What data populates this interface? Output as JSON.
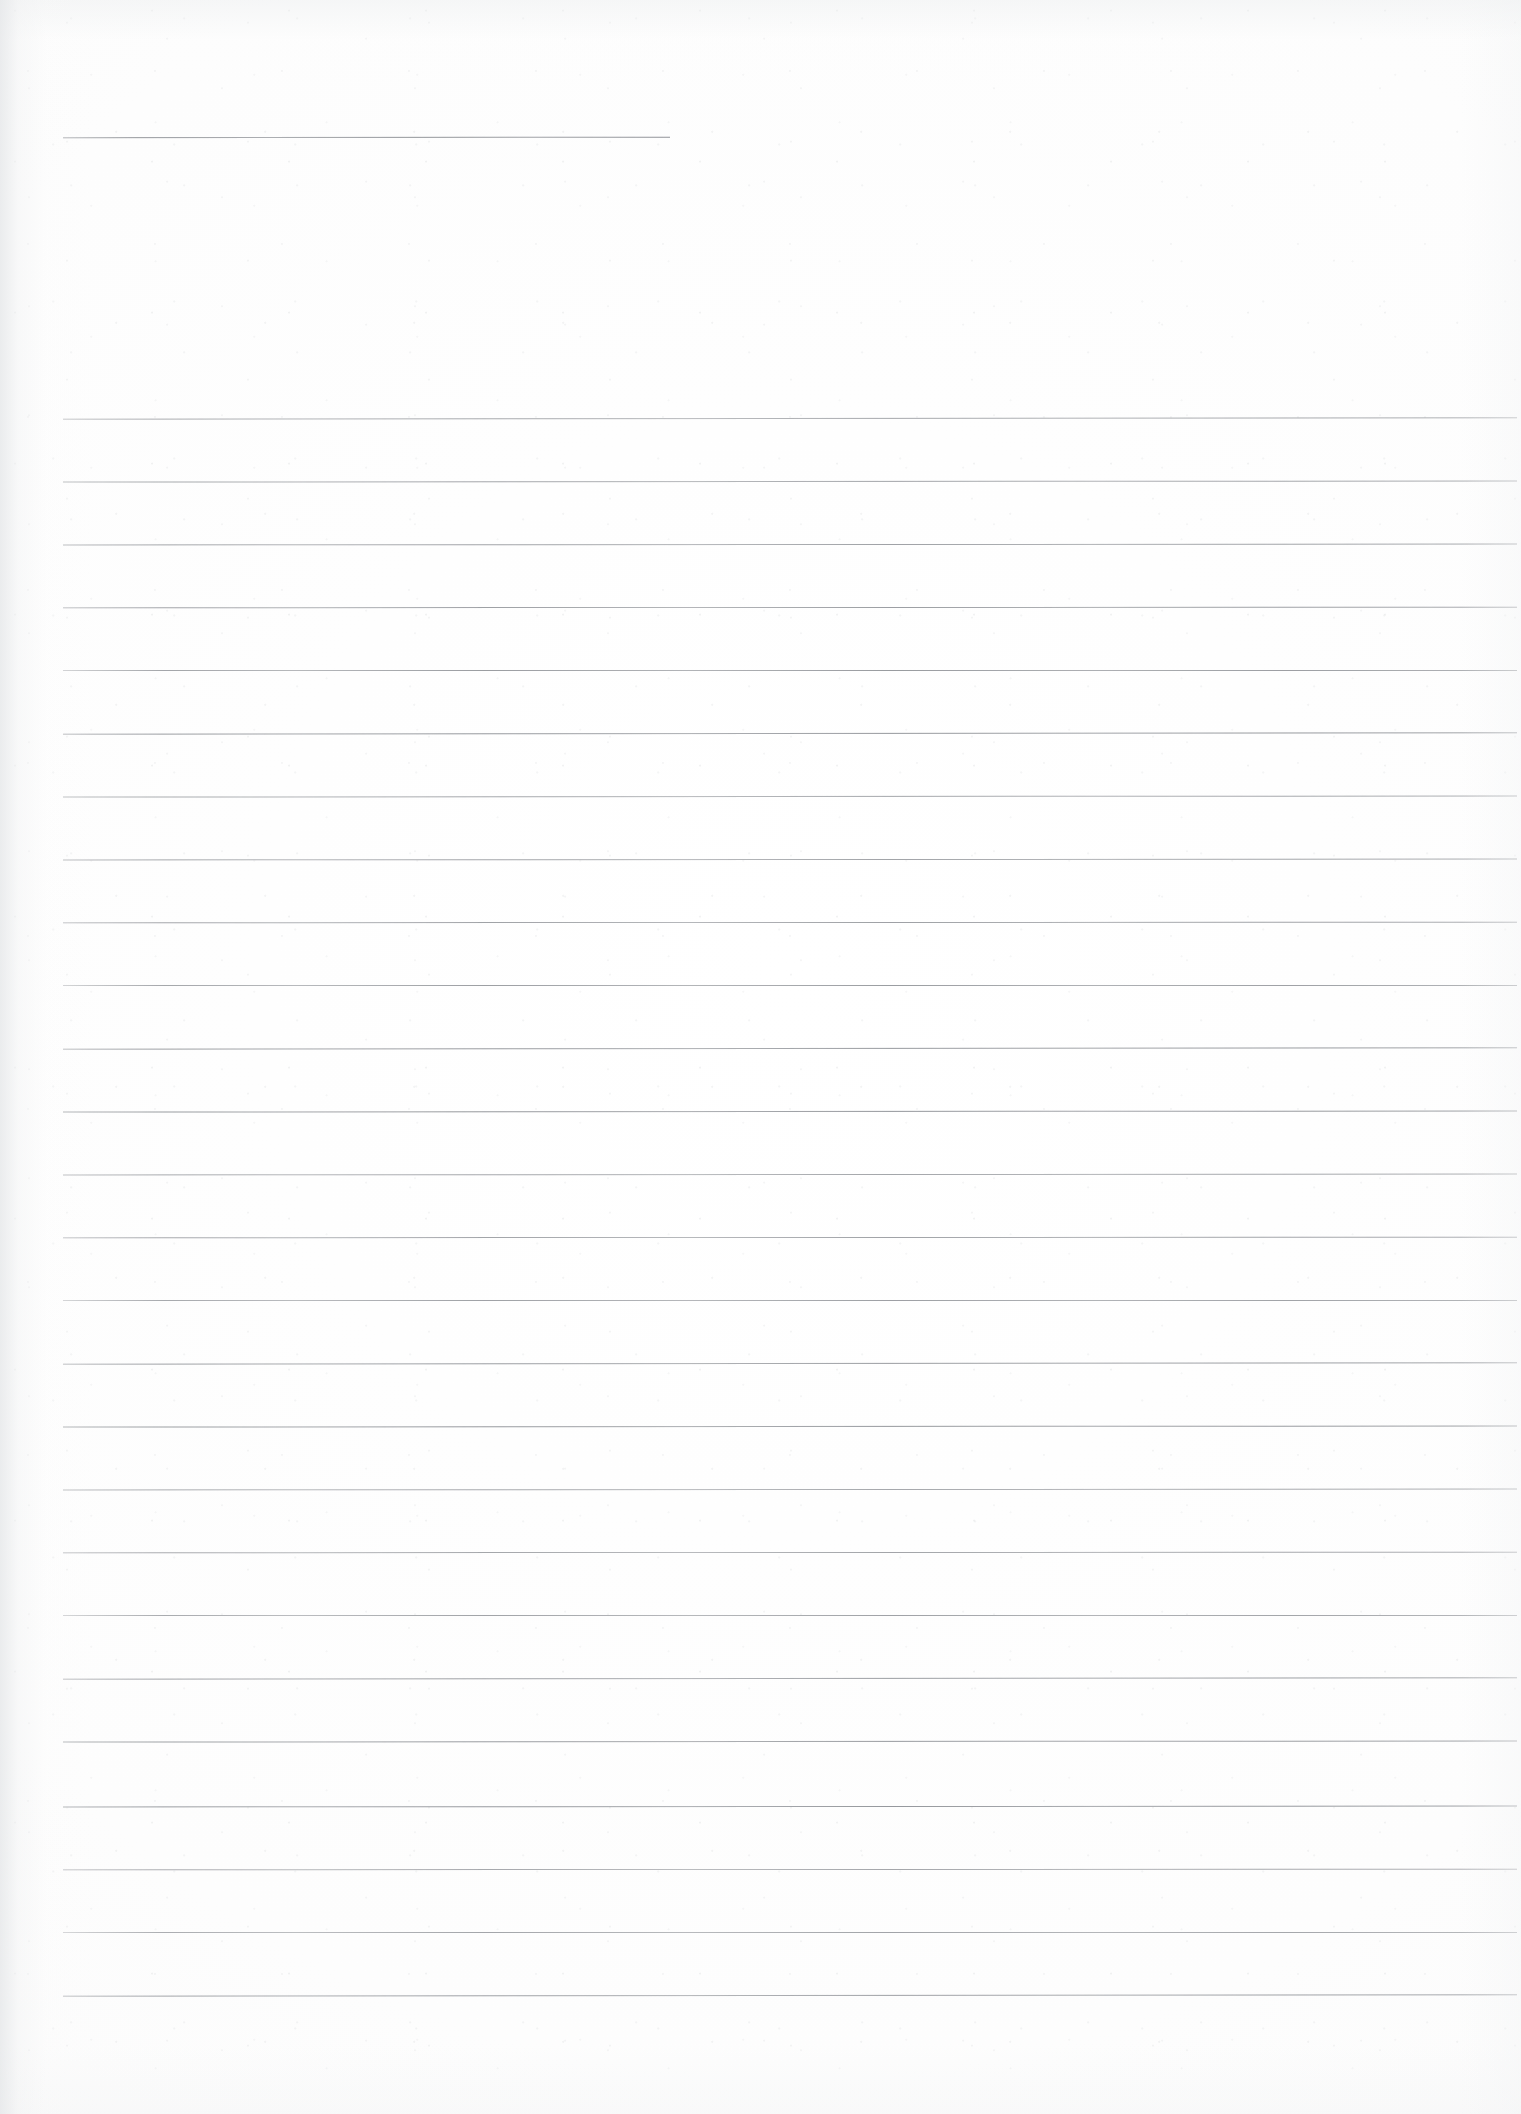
{
  "document": {
    "type": "scanned-lined-paper",
    "title_text": "",
    "body_text": "",
    "page_width": 1521,
    "page_height": 2114,
    "background_color": "#fdfdfd",
    "rule_color": "#8e9196",
    "header_rule_color": "#8a8d92"
  },
  "header_rule": {
    "name": "header-rule",
    "x": 63,
    "y": 137,
    "width": 607,
    "thickness": 1
  },
  "ruled_area": {
    "left": 63,
    "right": 1517,
    "width": 1454,
    "first_line_y": 418,
    "last_line_y": 1995,
    "line_spacing": 63,
    "line_count": 26,
    "thickness": 1,
    "lines": [
      {
        "index": 1,
        "y": 418
      },
      {
        "index": 2,
        "y": 481
      },
      {
        "index": 3,
        "y": 544
      },
      {
        "index": 4,
        "y": 607
      },
      {
        "index": 5,
        "y": 670
      },
      {
        "index": 6,
        "y": 733
      },
      {
        "index": 7,
        "y": 796
      },
      {
        "index": 8,
        "y": 859
      },
      {
        "index": 9,
        "y": 922
      },
      {
        "index": 10,
        "y": 985
      },
      {
        "index": 11,
        "y": 1048
      },
      {
        "index": 12,
        "y": 1111
      },
      {
        "index": 13,
        "y": 1174
      },
      {
        "index": 14,
        "y": 1237
      },
      {
        "index": 15,
        "y": 1300
      },
      {
        "index": 16,
        "y": 1363
      },
      {
        "index": 17,
        "y": 1426
      },
      {
        "index": 18,
        "y": 1489
      },
      {
        "index": 19,
        "y": 1552
      },
      {
        "index": 20,
        "y": 1615
      },
      {
        "index": 21,
        "y": 1678
      },
      {
        "index": 22,
        "y": 1741
      },
      {
        "index": 23,
        "y": 1806
      },
      {
        "index": 24,
        "y": 1869
      },
      {
        "index": 25,
        "y": 1932
      },
      {
        "index": 26,
        "y": 1995
      }
    ]
  },
  "margins": {
    "top_blank_height": 137,
    "gap_below_header_rule": 281,
    "bottom_blank_height": 119,
    "left_margin": 63,
    "right_margin": 4
  }
}
